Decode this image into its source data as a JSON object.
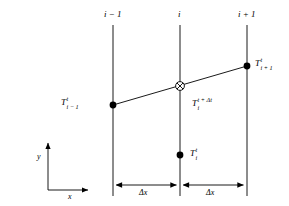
{
  "figure": {
    "background_color": "#ffffff",
    "line_color": "#000000",
    "marker_color": "#000000"
  },
  "grid_labels": [
    {
      "id": "left",
      "text": "i − 1"
    },
    {
      "id": "center",
      "text": "i"
    },
    {
      "id": "right",
      "text": "i + 1"
    }
  ],
  "node_labels": [
    {
      "id": "t-left",
      "base": "T",
      "sub": "i − 1",
      "sup": "t"
    },
    {
      "id": "t-center-new",
      "base": "T",
      "sub": "i",
      "sup": "t + Δt"
    },
    {
      "id": "t-right",
      "base": "T",
      "sub": "i + 1",
      "sup": "t"
    },
    {
      "id": "t-center-old",
      "base": "T",
      "sub": "i",
      "sup": "t"
    }
  ],
  "spacing_labels": [
    {
      "id": "dx-left",
      "text": "Δx"
    },
    {
      "id": "dx-right",
      "text": "Δx"
    }
  ],
  "axes": {
    "y_label": "y",
    "x_label": "x"
  },
  "markers": {
    "filled_dot": "filled-circle-marker",
    "crossed_circle": "crossed-circle-marker"
  }
}
